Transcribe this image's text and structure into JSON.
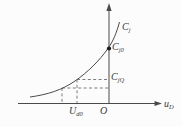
{
  "figure": {
    "kind": "capacitance-voltage characteristic curve"
  },
  "labels": {
    "curve": {
      "main": "C",
      "sub": "j"
    },
    "zero_bias_capacitance": {
      "main": "C",
      "sub": "j0"
    },
    "q_point_capacitance": {
      "main": "C",
      "sub": "jQ"
    },
    "bias_voltage": {
      "main": "U",
      "sub": "d0"
    },
    "origin": {
      "main": "O",
      "sub": ""
    },
    "x_axis": {
      "main": "u",
      "sub": "D"
    }
  },
  "colors": {
    "background": "#fcfcfc",
    "line": "#4a4a4a",
    "dashed": "#5a5a5a",
    "dot": "#1c1c1c",
    "text": "#3a3a3a"
  }
}
